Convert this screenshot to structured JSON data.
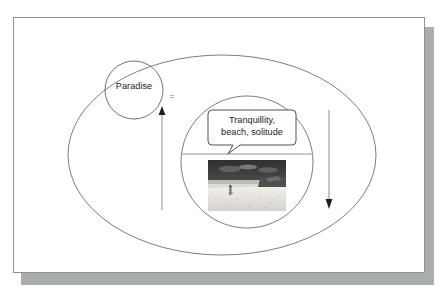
{
  "slide": {
    "background_color": "#ffffff",
    "border_color": "#8d9193",
    "shadow_color": "#a9adae"
  },
  "diagram": {
    "title": "",
    "outer_shape": {
      "name": "outer-ellipse",
      "label": "",
      "stroke_color": "#6b6f71"
    },
    "concept_circle": {
      "name": "paradise-circle",
      "label": "Paradise",
      "stroke_color": "#5f6365"
    },
    "relation": {
      "name": "equals-sign",
      "label": "=",
      "color": "#6f7476"
    },
    "instance_circle": {
      "name": "instance-circle",
      "stroke_color": "#6b6f71",
      "divider_color": "#8e9294"
    },
    "callout": {
      "name": "attributes-callout",
      "line1": "Tranquillity,",
      "line2": "beach, solitude",
      "stroke_color": "#3c3f41"
    },
    "photo": {
      "name": "beach-photo",
      "alt": "beach-photograph",
      "sky_color": "#3a3a3a",
      "sea_color": "#cfcfcf",
      "sand_color": "#e8e6e2"
    },
    "arrows": [
      {
        "name": "arrow-up-left",
        "direction": "up",
        "color": "#8a8e90"
      },
      {
        "name": "arrow-down-right",
        "direction": "down",
        "color": "#8a8e90"
      }
    ]
  }
}
